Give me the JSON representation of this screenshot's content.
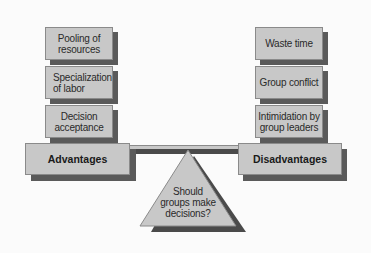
{
  "diagram": {
    "title": "Should groups make decisions?",
    "advantages": {
      "label": "Advantages",
      "items": [
        {
          "line1": "Pooling of",
          "line2": "resources"
        },
        {
          "line1": "Specialization",
          "line2": "of labor"
        },
        {
          "line1": "Decision",
          "line2": "acceptance"
        }
      ]
    },
    "disadvantages": {
      "label": "Disadvantages",
      "items": [
        {
          "line1": "Waste time",
          "line2": ""
        },
        {
          "line1": "Group conflict",
          "line2": ""
        },
        {
          "line1": "Intimidation by",
          "line2": "group leaders"
        }
      ]
    },
    "fulcrum": {
      "line1": "Should",
      "line2": "groups make",
      "line3": "decisions?"
    },
    "colors": {
      "box_fill": "#c8c8c8",
      "shadow": "#5a5a5a",
      "background": "#fbfbfb",
      "text": "#2a2a2a"
    }
  }
}
